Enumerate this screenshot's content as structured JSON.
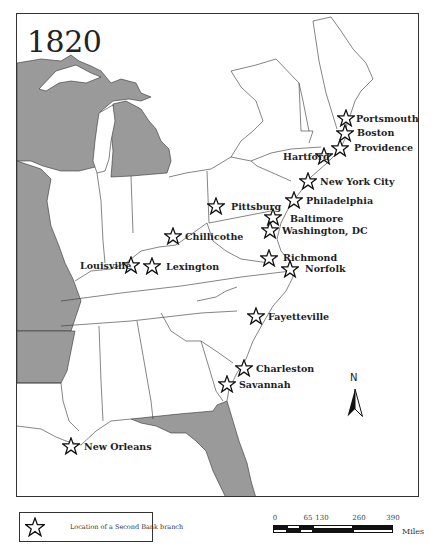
{
  "map": {
    "title": "1820",
    "colors": {
      "land_gray": "#9a9a9a",
      "land_white": "#ffffff",
      "water": "#ffffff",
      "border": "#333333"
    },
    "cities": [
      {
        "name": "Portsmouth",
        "star": [
          346,
          118
        ],
        "label": [
          356,
          114
        ]
      },
      {
        "name": "Boston",
        "star": [
          345,
          133
        ],
        "label": [
          357,
          128
        ]
      },
      {
        "name": "Providence",
        "star": [
          340,
          148
        ],
        "label": [
          354,
          143
        ]
      },
      {
        "name": "Hartford",
        "star": [
          324,
          156
        ],
        "label": [
          283,
          152
        ]
      },
      {
        "name": "New York City",
        "star": [
          308,
          181
        ],
        "label": [
          320,
          177
        ]
      },
      {
        "name": "Philadelphia",
        "star": [
          294,
          200
        ],
        "label": [
          306,
          196
        ]
      },
      {
        "name": "Pittsburg",
        "star": [
          216,
          206
        ],
        "label": [
          231,
          202
        ]
      },
      {
        "name": "Baltimore",
        "star": [
          273,
          217
        ],
        "label": [
          290,
          214
        ]
      },
      {
        "name": "Washington, DC",
        "star": [
          270,
          230
        ],
        "label": [
          282,
          226
        ]
      },
      {
        "name": "Chillicothe",
        "star": [
          173,
          236
        ],
        "label": [
          185,
          232
        ]
      },
      {
        "name": "Louisville",
        "star": [
          131,
          265
        ],
        "label": [
          80,
          261
        ]
      },
      {
        "name": "Lexington",
        "star": [
          152,
          266
        ],
        "label": [
          166,
          262
        ]
      },
      {
        "name": "Richmond",
        "star": [
          269,
          258
        ],
        "label": [
          283,
          253
        ]
      },
      {
        "name": "Norfolk",
        "star": [
          290,
          269
        ],
        "label": [
          305,
          264
        ]
      },
      {
        "name": "Fayetteville",
        "star": [
          256,
          316
        ],
        "label": [
          268,
          312
        ]
      },
      {
        "name": "Charleston",
        "star": [
          244,
          368
        ],
        "label": [
          256,
          364
        ]
      },
      {
        "name": "Savannah",
        "star": [
          227,
          384
        ],
        "label": [
          239,
          380
        ]
      },
      {
        "name": "New Orleans",
        "star": [
          71,
          446
        ],
        "label": [
          84,
          442
        ]
      }
    ],
    "compass": {
      "label": "N",
      "icon": "north-arrow-icon"
    }
  },
  "legend": {
    "icon": "star-outline-icon",
    "text": "Location of a Second Bank branch"
  },
  "scale": {
    "ticks": [
      "0",
      "65",
      "130",
      "260",
      "390"
    ],
    "tick_positions": [
      0,
      14,
      28,
      56,
      84
    ],
    "units": "Miles"
  }
}
